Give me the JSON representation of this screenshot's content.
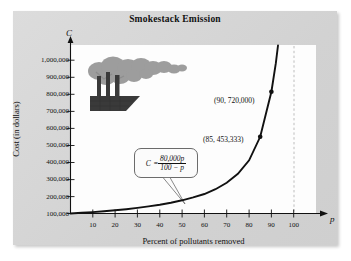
{
  "chart_data": {
    "type": "line",
    "title": "Smokestack Emission",
    "xlabel": "Percent of pollutants removed",
    "ylabel": "Cost (in dollars)",
    "x_var": "p",
    "y_var": "C",
    "equation": {
      "lhs": "C",
      "equals": "=",
      "numerator": "80,000p",
      "denominator": "100 − p",
      "plain": "C = 80,000p / (100 - p)"
    },
    "xlim": [
      0,
      105
    ],
    "ylim": [
      0,
      1050000
    ],
    "xticks": [
      10,
      20,
      30,
      40,
      50,
      60,
      70,
      80,
      90,
      100
    ],
    "xtick_labels": [
      "10",
      "20",
      "30",
      "40",
      "50",
      "60",
      "70",
      "80",
      "90",
      "100"
    ],
    "yticks": [
      100000,
      200000,
      300000,
      400000,
      500000,
      600000,
      700000,
      800000,
      900000,
      1000000
    ],
    "ytick_labels": [
      "100,000",
      "200,000",
      "300,000",
      "400,000",
      "500,000",
      "600,000",
      "700,000",
      "800,000",
      "900,000",
      "1,000,000"
    ],
    "grid": false,
    "legend": false,
    "asymptote": {
      "type": "vertical",
      "x": 100,
      "style": "dashed"
    },
    "points": [
      {
        "x": 90,
        "y": 720000,
        "label": "(90, 720,000)"
      },
      {
        "x": 85,
        "y": 453333,
        "label": "(85, 453,333)"
      }
    ],
    "series": [
      {
        "name": "Cost curve",
        "x": [
          0,
          5,
          10,
          15,
          20,
          25,
          30,
          35,
          40,
          45,
          50,
          55,
          60,
          65,
          70,
          75,
          80,
          85,
          90,
          92,
          93
        ],
        "values": [
          0,
          4211,
          8889,
          14118,
          20000,
          26667,
          34286,
          43077,
          53333,
          65455,
          80000,
          97778,
          120000,
          148571,
          186667,
          240000,
          320000,
          453333,
          720000,
          920000,
          1062857
        ]
      }
    ],
    "annotations": [
      {
        "name": "smokestack-illustration",
        "description": "factory with three smokestacks emitting gray smoke"
      }
    ],
    "colors": {
      "panel": "#d4d4d4",
      "plot_background": "#fdfdfd",
      "curve": "#111111",
      "asymptote": "#b8b8b8",
      "text": "#111111",
      "smoke": "#9a9a9a",
      "factory": "#3a3a3a"
    }
  }
}
